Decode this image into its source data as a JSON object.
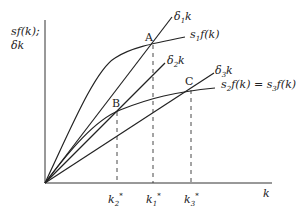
{
  "diagram": {
    "y_axis_label_line1": "sf(k);",
    "y_axis_label_line2": "δk",
    "x_axis_label": "k",
    "points": {
      "A": "A",
      "B": "B",
      "C": "C"
    },
    "lines": {
      "delta1": {
        "base": "δ",
        "sub": "1",
        "tail": "k"
      },
      "delta2": {
        "base": "δ",
        "sub": "2",
        "tail": "k"
      },
      "delta3": {
        "base": "δ",
        "sub": "3",
        "tail": "k"
      },
      "s1f": {
        "base": "s",
        "sub": "1",
        "tail": "f(k)"
      },
      "s2f": {
        "base": "s",
        "sub": "2",
        "tail": "f(k) = s"
      },
      "s3f": {
        "sub": "3",
        "tail": "f(k)"
      }
    },
    "x_ticks": {
      "k2": {
        "base": "k",
        "sub": "2",
        "sup": "*"
      },
      "k1": {
        "base": "k",
        "sub": "1",
        "sup": "*"
      },
      "k3": {
        "base": "k",
        "sub": "3",
        "sup": "*"
      }
    }
  }
}
